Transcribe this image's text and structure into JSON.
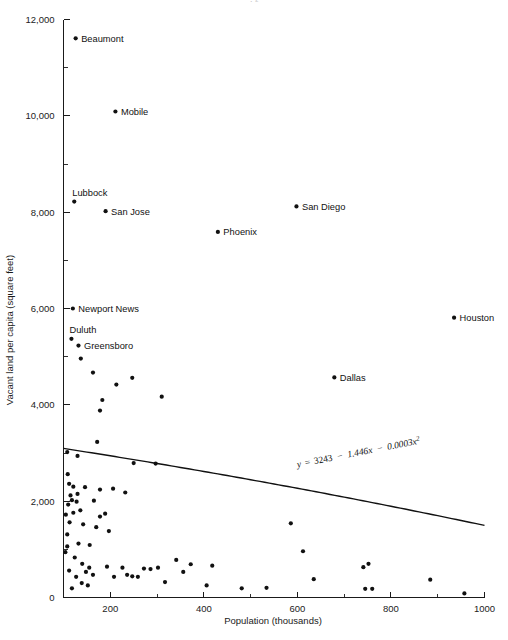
{
  "figure": {
    "width": 508,
    "height": 640,
    "background": "#ffffff",
    "ink_color": "#111111",
    "clipped_header": "· ²"
  },
  "axes": {
    "x_title": "Population  (thousands)",
    "y_title": "Vacant land per capita (square feet)",
    "x_ticks": [
      "200",
      "400",
      "600",
      "800",
      "1000"
    ],
    "y_ticks": [
      "0",
      "2,000",
      "4,000",
      "6,000",
      "8,000",
      "10,000",
      "12,000"
    ],
    "x_min": 100,
    "x_max": 1000,
    "y_min": 0,
    "y_max": 12000,
    "x_tick_values": [
      200,
      400,
      600,
      800,
      1000
    ],
    "y_tick_values": [
      0,
      2000,
      4000,
      6000,
      8000,
      10000,
      12000
    ],
    "x_minor_values": [
      300,
      500,
      700,
      900
    ],
    "y_minor_values": [
      1000,
      3000,
      5000,
      7000,
      9000,
      11000
    ],
    "grid": false,
    "legend": "none"
  },
  "annotation": {
    "equation": "y = 3243 − 1.446x − 0.0003x²",
    "equation_parts": {
      "lhs": "y",
      "eq": "=",
      "intercept": "3243",
      "minus1": "−",
      "linear": "1.446x",
      "minus2": "−",
      "quadratic": "0.0003x",
      "exponent": "2"
    },
    "rotation_deg": -11
  },
  "chart_data": {
    "type": "scatter",
    "title": "",
    "xlabel": "Population  (thousands)",
    "ylabel": "Vacant land per capita (square feet)",
    "xlim": [
      100,
      1000
    ],
    "ylim": [
      0,
      12000
    ],
    "grid": false,
    "legend_position": "none",
    "fit": {
      "label": "y = 3243 − 1.446x − 0.0003x²",
      "form": "quadratic",
      "intercept": 3243,
      "linear_coef": -1.446,
      "quadratic_coef": -0.0003,
      "x_range": [
        100,
        1000
      ]
    },
    "labeled_points": [
      {
        "name": "Beaumont",
        "x": 126,
        "y": 11610,
        "label_side": "right"
      },
      {
        "name": "Mobile",
        "x": 211,
        "y": 10090,
        "label_side": "right"
      },
      {
        "name": "Lubbock",
        "x": 123,
        "y": 8220,
        "label_side": "above"
      },
      {
        "name": "San Jose",
        "x": 190,
        "y": 8020,
        "label_side": "right"
      },
      {
        "name": "San Diego",
        "x": 598,
        "y": 8120,
        "label_side": "right"
      },
      {
        "name": "Phoenix",
        "x": 430,
        "y": 7590,
        "label_side": "right"
      },
      {
        "name": "Newport News",
        "x": 120,
        "y": 6000,
        "label_side": "right"
      },
      {
        "name": "Duluth",
        "x": 117,
        "y": 5370,
        "label_side": "above"
      },
      {
        "name": "Greensboro",
        "x": 132,
        "y": 5230,
        "label_side": "right"
      },
      {
        "name": "Houston",
        "x": 935,
        "y": 5810,
        "label_side": "right"
      },
      {
        "name": "Dallas",
        "x": 679,
        "y": 4570,
        "label_side": "right"
      }
    ],
    "unlabeled_points": [
      {
        "x": 137,
        "y": 4960
      },
      {
        "x": 163,
        "y": 4670
      },
      {
        "x": 213,
        "y": 4420
      },
      {
        "x": 247,
        "y": 4560
      },
      {
        "x": 183,
        "y": 4100
      },
      {
        "x": 178,
        "y": 3880
      },
      {
        "x": 310,
        "y": 4170
      },
      {
        "x": 172,
        "y": 3230
      },
      {
        "x": 108,
        "y": 3020
      },
      {
        "x": 130,
        "y": 2940
      },
      {
        "x": 250,
        "y": 2790
      },
      {
        "x": 297,
        "y": 2780
      },
      {
        "x": 112,
        "y": 2360
      },
      {
        "x": 121,
        "y": 2300
      },
      {
        "x": 146,
        "y": 2290
      },
      {
        "x": 130,
        "y": 2150
      },
      {
        "x": 115,
        "y": 2120
      },
      {
        "x": 118,
        "y": 2020
      },
      {
        "x": 128,
        "y": 1990
      },
      {
        "x": 110,
        "y": 1930
      },
      {
        "x": 178,
        "y": 2240
      },
      {
        "x": 206,
        "y": 2260
      },
      {
        "x": 232,
        "y": 2180
      },
      {
        "x": 189,
        "y": 1740
      },
      {
        "x": 178,
        "y": 1680
      },
      {
        "x": 136,
        "y": 1810
      },
      {
        "x": 121,
        "y": 1760
      },
      {
        "x": 113,
        "y": 1560
      },
      {
        "x": 142,
        "y": 1520
      },
      {
        "x": 170,
        "y": 1460
      },
      {
        "x": 197,
        "y": 1380
      },
      {
        "x": 108,
        "y": 1310
      },
      {
        "x": 108,
        "y": 1060
      },
      {
        "x": 132,
        "y": 1120
      },
      {
        "x": 156,
        "y": 1090
      },
      {
        "x": 104,
        "y": 940
      },
      {
        "x": 124,
        "y": 830
      },
      {
        "x": 140,
        "y": 700
      },
      {
        "x": 155,
        "y": 620
      },
      {
        "x": 148,
        "y": 530
      },
      {
        "x": 163,
        "y": 470
      },
      {
        "x": 112,
        "y": 560
      },
      {
        "x": 127,
        "y": 430
      },
      {
        "x": 139,
        "y": 300
      },
      {
        "x": 152,
        "y": 250
      },
      {
        "x": 118,
        "y": 190
      },
      {
        "x": 193,
        "y": 640
      },
      {
        "x": 208,
        "y": 430
      },
      {
        "x": 226,
        "y": 620
      },
      {
        "x": 236,
        "y": 470
      },
      {
        "x": 247,
        "y": 440
      },
      {
        "x": 259,
        "y": 430
      },
      {
        "x": 272,
        "y": 600
      },
      {
        "x": 286,
        "y": 590
      },
      {
        "x": 302,
        "y": 620
      },
      {
        "x": 317,
        "y": 320
      },
      {
        "x": 341,
        "y": 780
      },
      {
        "x": 356,
        "y": 530
      },
      {
        "x": 372,
        "y": 690
      },
      {
        "x": 406,
        "y": 250
      },
      {
        "x": 418,
        "y": 660
      },
      {
        "x": 481,
        "y": 190
      },
      {
        "x": 534,
        "y": 200
      },
      {
        "x": 586,
        "y": 1540
      },
      {
        "x": 612,
        "y": 960
      },
      {
        "x": 635,
        "y": 380
      },
      {
        "x": 741,
        "y": 630
      },
      {
        "x": 752,
        "y": 700
      },
      {
        "x": 745,
        "y": 180
      },
      {
        "x": 760,
        "y": 180
      },
      {
        "x": 884,
        "y": 370
      },
      {
        "x": 957,
        "y": 85
      },
      {
        "x": 109,
        "y": 2560
      },
      {
        "x": 105,
        "y": 1720
      },
      {
        "x": 165,
        "y": 2010
      }
    ]
  }
}
